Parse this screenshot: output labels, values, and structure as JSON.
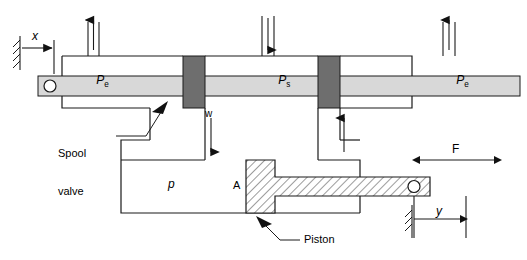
{
  "figure": {
    "type": "engineering-schematic",
    "background_color": "#ffffff",
    "line_color": "#1a1a1a",
    "spool_rod_color": "#d8d8d8",
    "spool_land_color": "#6e6e6e",
    "piston_hatch_color": "#555555"
  },
  "labels": {
    "pe_left": "P",
    "pe_left_sub": "e",
    "ps_center": "P",
    "ps_center_sub": "s",
    "pe_right": "P",
    "pe_right_sub": "e",
    "x_dimension": "x",
    "w_dimension": "w",
    "y_dimension": "y",
    "force": "F",
    "pressure_p": "p",
    "area_a": "A",
    "spool_valve_line1": "Spool",
    "spool_valve_line2": "valve",
    "piston": "Piston"
  },
  "annotations": [
    {
      "name": "x-displacement",
      "text": "x",
      "meaning": "spool displacement input"
    },
    {
      "name": "w-port-width",
      "text": "w",
      "meaning": "valve port opening width"
    },
    {
      "name": "y-displacement",
      "text": "y",
      "meaning": "piston rod output displacement"
    },
    {
      "name": "load-force",
      "text": "F",
      "meaning": "external load force on rod"
    },
    {
      "name": "chamber-pressure",
      "text": "p",
      "meaning": "cylinder chamber pressure"
    },
    {
      "name": "piston-area",
      "text": "A",
      "meaning": "piston face area"
    },
    {
      "name": "exhaust-pressure-left",
      "text": "Pe",
      "meaning": "exhaust / return pressure"
    },
    {
      "name": "supply-pressure",
      "text": "Ps",
      "meaning": "supply pressure"
    },
    {
      "name": "exhaust-pressure-right",
      "text": "Pe",
      "meaning": "exhaust / return pressure"
    }
  ],
  "callouts": [
    {
      "name": "spool-valve-callout",
      "text": "Spool valve",
      "points_to": "spool rod"
    },
    {
      "name": "piston-callout",
      "text": "Piston",
      "points_to": "piston body"
    }
  ],
  "flow_arrows": [
    {
      "name": "pe-left-arrow",
      "direction": "up",
      "meaning": "exhaust flow out"
    },
    {
      "name": "ps-arrow",
      "direction": "down",
      "meaning": "supply flow in"
    },
    {
      "name": "pe-right-arrow",
      "direction": "up",
      "meaning": "exhaust flow out"
    },
    {
      "name": "w-flow-arrow",
      "direction": "down",
      "meaning": "metered flow into cylinder"
    },
    {
      "name": "return-flow-arrow",
      "direction": "up",
      "meaning": "return flow from cylinder"
    }
  ]
}
